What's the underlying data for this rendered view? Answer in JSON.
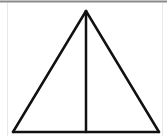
{
  "diagram": {
    "type": "geometry",
    "shape": "isosceles-triangle-with-altitude",
    "canvas": {
      "width": 167,
      "height": 136
    },
    "colors": {
      "stroke": "#111111",
      "background": "#ffffff",
      "top_border": "#8a8a8a",
      "side_border": "#e2e2e2"
    },
    "vertices": {
      "apex": [
        86,
        11
      ],
      "base_left": [
        13,
        132
      ],
      "base_right": [
        159,
        132
      ],
      "altitude_foot": [
        86,
        132
      ]
    },
    "segments": [
      {
        "name": "left-side",
        "from": "apex",
        "to": "base_left"
      },
      {
        "name": "right-side",
        "from": "apex",
        "to": "base_right"
      },
      {
        "name": "base",
        "from": "base_left",
        "to": "base_right"
      },
      {
        "name": "altitude",
        "from": "apex",
        "to": "altitude_foot"
      }
    ]
  }
}
